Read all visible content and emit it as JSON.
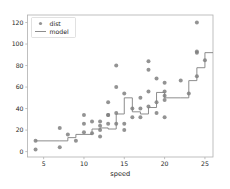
{
  "chart_data": {
    "type": "scatter",
    "title": "",
    "xlabel": "speed",
    "ylabel": "",
    "xlim": [
      3.0,
      26.0
    ],
    "ylim": [
      -5.0,
      127.0
    ],
    "xticks": [
      5,
      10,
      15,
      20,
      25
    ],
    "xticklabels": [
      "5",
      "10",
      "15",
      "20",
      "25"
    ],
    "yticks": [
      0,
      20,
      40,
      60,
      80,
      100,
      120
    ],
    "yticklabels": [
      "0",
      "20",
      "40",
      "60",
      "80",
      "100",
      "120"
    ],
    "grid": false,
    "legend_position": "upper left",
    "legend": [
      {
        "label": "dist",
        "kind": "marker",
        "color": "#808080"
      },
      {
        "label": "model",
        "kind": "line",
        "color": "#808080"
      }
    ],
    "series": [
      {
        "name": "dist",
        "kind": "scatter",
        "color": "#808080",
        "marker": "o",
        "markersize": 3.0,
        "x": [
          4,
          4,
          7,
          7,
          8,
          9,
          10,
          10,
          10,
          11,
          11,
          12,
          12,
          12,
          12,
          13,
          13,
          13,
          13,
          14,
          14,
          14,
          14,
          15,
          15,
          15,
          16,
          16,
          17,
          17,
          17,
          18,
          18,
          18,
          18,
          19,
          19,
          19,
          20,
          20,
          20,
          20,
          20,
          22,
          23,
          24,
          24,
          24,
          24,
          25
        ],
        "y": [
          2,
          10,
          4,
          22,
          16,
          10,
          18,
          26,
          34,
          17,
          28,
          14,
          20,
          24,
          28,
          26,
          34,
          34,
          46,
          26,
          36,
          60,
          80,
          20,
          26,
          54,
          32,
          40,
          32,
          40,
          50,
          42,
          56,
          76,
          84,
          36,
          46,
          68,
          32,
          48,
          52,
          56,
          64,
          66,
          54,
          70,
          92,
          93,
          120,
          85
        ]
      },
      {
        "name": "model",
        "kind": "step",
        "color": "#808080",
        "linewidth": 0.9,
        "x": [
          4,
          7,
          8,
          9,
          10,
          11,
          12,
          13,
          14,
          15,
          16,
          17,
          18,
          19,
          20,
          22,
          23,
          24,
          25,
          26
        ],
        "y": [
          10,
          10,
          13,
          16,
          16,
          21,
          22,
          21,
          35,
          50,
          37,
          35,
          41,
          55,
          50,
          50,
          66,
          78,
          92,
          92
        ]
      }
    ]
  },
  "axes": {
    "x_axis_label": "speed"
  }
}
